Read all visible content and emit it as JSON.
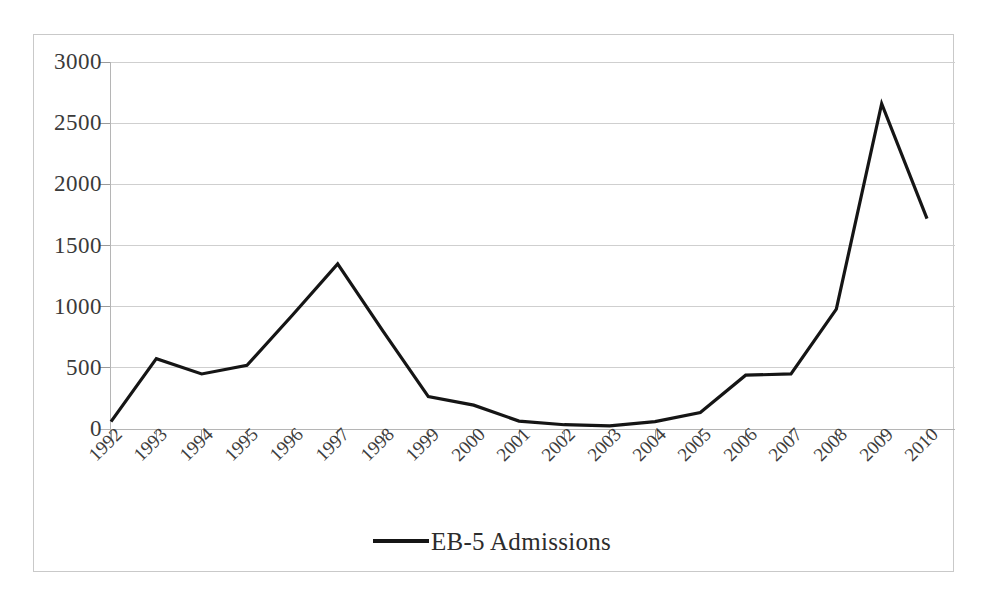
{
  "chart_data": {
    "type": "line",
    "title": "",
    "subtitle": "",
    "xlabel": "",
    "ylabel": "",
    "categories": [
      "1992",
      "1993",
      "1994",
      "1995",
      "1996",
      "1997",
      "1998",
      "1999",
      "2000",
      "2001",
      "2002",
      "2003",
      "2004",
      "2005",
      "2006",
      "2007",
      "2008",
      "2009",
      "2010"
    ],
    "series": [
      {
        "name": "EB-5 Admissions",
        "color": "#151515",
        "values": [
          60,
          575,
          450,
          520,
          930,
          1350,
          800,
          265,
          195,
          65,
          35,
          25,
          60,
          135,
          440,
          450,
          980,
          2660,
          1720
        ]
      }
    ],
    "ylim": [
      0,
      3000
    ],
    "yticks": [
      0,
      500,
      1000,
      1500,
      2000,
      2500,
      3000
    ],
    "ytick_labels": [
      "0",
      "500",
      "1000",
      "1500",
      "2000",
      "2500",
      "3000"
    ],
    "grid": true,
    "grid_axis": "y",
    "legend_position": "bottom",
    "legend_entries": [
      "EB-5 Admissions"
    ],
    "annotations": []
  },
  "legend": {
    "label": "EB-5 Admissions",
    "swatch_name": "line-swatch"
  },
  "colors": {
    "series": "#151515",
    "gridline": "#cfcfcf",
    "axis": "#b5b5b5",
    "frame": "#c9c9c9",
    "background": "#ffffff",
    "tick_text": "#3a3a3a"
  }
}
